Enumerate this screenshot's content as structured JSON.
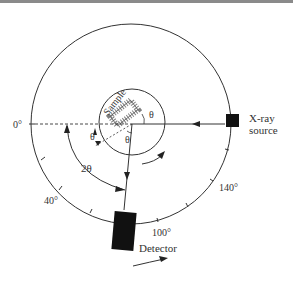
{
  "diagram": {
    "labels": {
      "sample": "Sample",
      "theta": "θ",
      "two_theta": "2θ",
      "source": [
        "X-ray",
        "source"
      ],
      "detector": "Detector"
    },
    "scale": {
      "angle_0": "0°",
      "angle_40": "40°",
      "angle_100": "100°",
      "angle_140": "140°"
    },
    "colors": {
      "line": "#333333",
      "fill": "#111111",
      "background": "#ffffff"
    }
  }
}
